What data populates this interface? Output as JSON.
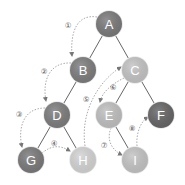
{
  "diagram": {
    "type": "tree-traversal",
    "nodes": [
      {
        "id": "A",
        "label": "A",
        "x": 109,
        "y": 24,
        "color": "#7a7a7a"
      },
      {
        "id": "B",
        "label": "B",
        "x": 83,
        "y": 70,
        "color": "#7d7d7d"
      },
      {
        "id": "C",
        "label": "C",
        "x": 135,
        "y": 70,
        "color": "#c4c4c4"
      },
      {
        "id": "D",
        "label": "D",
        "x": 57,
        "y": 115,
        "color": "#7d7d7d"
      },
      {
        "id": "E",
        "label": "E",
        "x": 109,
        "y": 115,
        "color": "#c0c0c0"
      },
      {
        "id": "F",
        "label": "F",
        "x": 161,
        "y": 115,
        "color": "#666666"
      },
      {
        "id": "G",
        "label": "G",
        "x": 31,
        "y": 160,
        "color": "#7a7a7a"
      },
      {
        "id": "H",
        "label": "H",
        "x": 83,
        "y": 160,
        "color": "#d4d4d4"
      },
      {
        "id": "I",
        "label": "I",
        "x": 135,
        "y": 160,
        "color": "#c4c4c4"
      }
    ],
    "edges": [
      {
        "from": "A",
        "to": "B"
      },
      {
        "from": "A",
        "to": "C"
      },
      {
        "from": "B",
        "to": "D"
      },
      {
        "from": "C",
        "to": "E"
      },
      {
        "from": "C",
        "to": "F"
      },
      {
        "from": "D",
        "to": "G"
      },
      {
        "from": "D",
        "to": "H"
      },
      {
        "from": "E",
        "to": "I"
      }
    ],
    "steps": [
      {
        "label": "①",
        "from": "A",
        "to": "B",
        "lx": 68,
        "ly": 25
      },
      {
        "label": "②",
        "from": "B",
        "to": "D",
        "lx": 44,
        "ly": 71
      },
      {
        "label": "③",
        "from": "D",
        "to": "G",
        "lx": 19,
        "ly": 114
      },
      {
        "label": "④",
        "from": "G",
        "to": "H",
        "lx": 54,
        "ly": 143
      },
      {
        "label": "⑤",
        "from": "H",
        "to": "C",
        "lx": 86,
        "ly": 99
      },
      {
        "label": "⑥",
        "from": "C",
        "to": "E",
        "lx": 113,
        "ly": 87
      },
      {
        "label": "⑦",
        "from": "E",
        "to": "I",
        "lx": 104,
        "ly": 145
      },
      {
        "label": "⑧",
        "from": "I",
        "to": "F",
        "lx": 132,
        "ly": 128
      }
    ]
  }
}
